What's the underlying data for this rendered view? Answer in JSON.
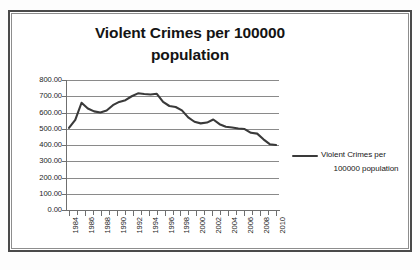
{
  "figure": {
    "title_line1": "Violent Crimes per 100000",
    "title_line2": "population",
    "frame_color": "#4a4a4a",
    "background": "#ffffff"
  },
  "legend": {
    "label_line1": "Violent Crimes per",
    "label_line2": "100000 population",
    "swatch_color": "#3a3a3a",
    "position": "right"
  },
  "axes": {
    "y_ticks": [
      "800.00",
      "700.00",
      "600.00",
      "500.00",
      "400.00",
      "300.00",
      "200.00",
      "100.00",
      "0.00"
    ],
    "x_ticks_labeled": [
      "1984",
      "1986",
      "1988",
      "1990",
      "1992",
      "1994",
      "1996",
      "1998",
      "2000",
      "2002",
      "2004",
      "2006",
      "2008",
      "2010"
    ]
  },
  "chart_data": {
    "type": "line",
    "title": "Violent Crimes per 100000 population",
    "xlabel": "",
    "ylabel": "",
    "ylim": [
      0,
      800
    ],
    "ytick_step": 100,
    "grid": true,
    "legend_position": "right",
    "line_color": "#3a3a3a",
    "x": [
      1984,
      1985,
      1986,
      1987,
      1988,
      1989,
      1990,
      1991,
      1992,
      1993,
      1994,
      1995,
      1996,
      1997,
      1998,
      1999,
      2000,
      2001,
      2002,
      2003,
      2004,
      2005,
      2006,
      2007,
      2008,
      2009,
      2010
    ],
    "series": [
      {
        "name": "Violent Crimes per 100000 population",
        "values": [
          539.9,
          558.1,
          620.1,
          612.5,
          640.6,
          666.9,
          731.8,
          758.2,
          757.7,
          747.1,
          713.6,
          684.5,
          636.6,
          611.0,
          567.6,
          523.0,
          506.5,
          504.5,
          494.4,
          475.8,
          463.2,
          469.0,
          479.3,
          471.8,
          458.6,
          431.9,
          404.5
        ]
      }
    ]
  },
  "plot_points_px": {
    "comment": "normalized (year, value) used to draw the polyline",
    "values": [
      505,
      555,
      660,
      625,
      607,
      600,
      612,
      645,
      665,
      676,
      700,
      718,
      714,
      711,
      715,
      665,
      640,
      634,
      613,
      570,
      543,
      533,
      538,
      557,
      528,
      512,
      508,
      502,
      498,
      475,
      470,
      435,
      405,
      400
    ]
  }
}
